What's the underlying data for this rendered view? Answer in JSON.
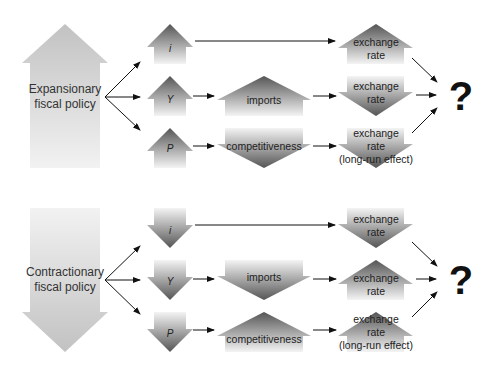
{
  "panels": [
    {
      "policy": {
        "label_line1": "Expansionary",
        "label_line2": "fiscal policy",
        "direction": "up"
      },
      "rows": [
        {
          "var": "i",
          "var_dir": "up",
          "mid": null,
          "mid_dir": null,
          "fx_line1": "exchange",
          "fx_line2": "rate",
          "fx_line3": null,
          "fx_dir": "up"
        },
        {
          "var": "Y",
          "var_dir": "up",
          "mid": "imports",
          "mid_dir": "up",
          "fx_line1": "exchange",
          "fx_line2": "rate",
          "fx_line3": null,
          "fx_dir": "down"
        },
        {
          "var": "P",
          "var_dir": "up",
          "mid": "competitiveness",
          "mid_dir": "down",
          "fx_line1": "exchange",
          "fx_line2": "rate",
          "fx_line3": "(long-run effect)",
          "fx_dir": "down"
        }
      ],
      "result": "?"
    },
    {
      "policy": {
        "label_line1": "Contractionary",
        "label_line2": "fiscal policy",
        "direction": "down"
      },
      "rows": [
        {
          "var": "i",
          "var_dir": "down",
          "mid": null,
          "mid_dir": null,
          "fx_line1": "exchange",
          "fx_line2": "rate",
          "fx_line3": null,
          "fx_dir": "down"
        },
        {
          "var": "Y",
          "var_dir": "down",
          "mid": "imports",
          "mid_dir": "down",
          "fx_line1": "exchange",
          "fx_line2": "rate",
          "fx_line3": null,
          "fx_dir": "up"
        },
        {
          "var": "P",
          "var_dir": "down",
          "mid": "competitiveness",
          "mid_dir": "up",
          "fx_line1": "exchange",
          "fx_line2": "rate",
          "fx_line3": "(long-run effect)",
          "fx_dir": "up"
        }
      ],
      "result": "?"
    }
  ],
  "colors": {
    "arrow_dark": "#555555",
    "arrow_light": "#f4f4f4",
    "policy_dark": "#c4c4c4",
    "policy_light": "#f0f0f0",
    "line": "#111111"
  }
}
